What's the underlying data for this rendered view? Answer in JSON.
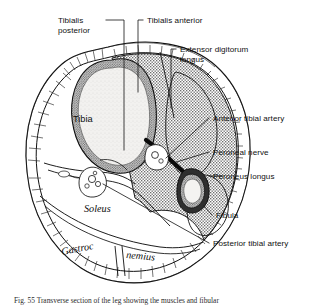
{
  "figure": {
    "caption_partial": "Fig. 55  Transverse section of the leg showing the muscles and fibular",
    "colors": {
      "ink": "#111111",
      "muscle_gray": "#b9b9b9",
      "bone_cortex": "#8f8f8f",
      "marrow": "#f0f0ee",
      "fat_fill": "#ffffff",
      "background": "#ffffff"
    }
  },
  "labels": {
    "tibialis_posterior": {
      "line1": "Tibialis",
      "line2": "posterior"
    },
    "tibialis_anterior": {
      "line1": "Tibialis anterior"
    },
    "extensor_digitorum_longus": {
      "line1": "Extensor digitorum",
      "line2": "longus"
    },
    "anterior_tibial_artery": {
      "line1": "Anterior tibial artery"
    },
    "peroneal_nerve": {
      "line1": "Peroneal nerve"
    },
    "peroneus_longus": {
      "line1": "Peroneus longus"
    },
    "fibula": {
      "line1": "Fibula"
    },
    "posterior_tibial_artery": {
      "line1": "Posterior tibial artery"
    }
  },
  "inner_labels": {
    "tibia": "Tibia",
    "soleus": "Soleus",
    "gastroc_left": "Gastroc",
    "gastroc_right": "nemius"
  }
}
